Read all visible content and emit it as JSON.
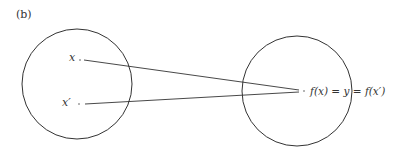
{
  "figure": {
    "panel_label": "(b)",
    "domain_set": {
      "points": [
        {
          "label": "x"
        },
        {
          "label": "x′"
        }
      ]
    },
    "codomain_set": {
      "point": {
        "label": "f(x) = y = f(x′)"
      }
    },
    "colors": {
      "stroke": "#333333",
      "text": "#333333",
      "background": "#ffffff"
    }
  }
}
